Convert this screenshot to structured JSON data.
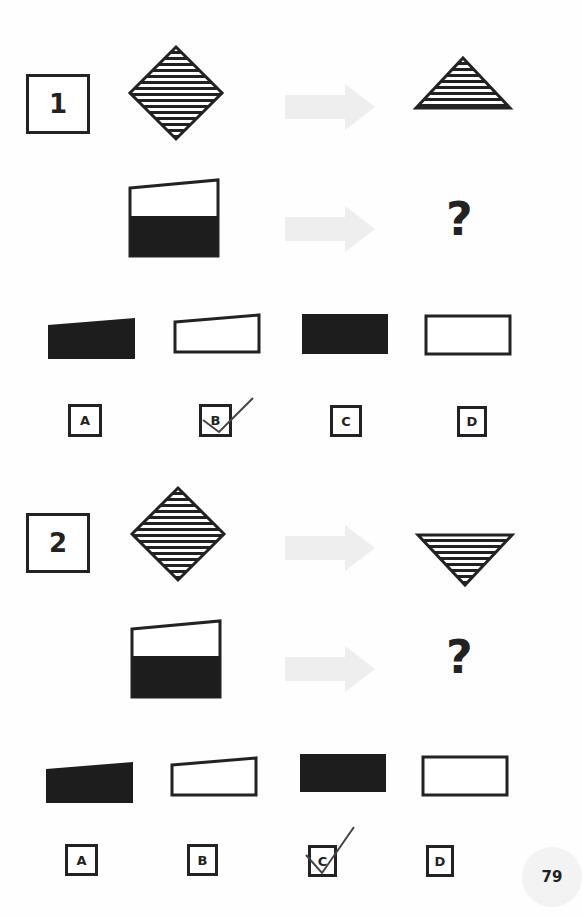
{
  "page": {
    "number": "79",
    "background": "#fefefe",
    "ink": "#222222",
    "arrow_color": "#eeeeee"
  },
  "questions": [
    {
      "number": "1",
      "example": {
        "from": "diamond-horizontal-stripes",
        "to": "upward-triangle-horizontal-stripes (top half of diamond)"
      },
      "problem": {
        "from": "quadrilateral sloped top, white top / black bottom",
        "to": "?"
      },
      "options": [
        {
          "label": "A",
          "shape": "black trapezoid with sloped top"
        },
        {
          "label": "B",
          "shape": "white trapezoid with sloped top (outlined)"
        },
        {
          "label": "C",
          "shape": "black rectangle"
        },
        {
          "label": "D",
          "shape": "white rectangle (outlined)"
        }
      ],
      "checked": "B"
    },
    {
      "number": "2",
      "example": {
        "from": "diamond-horizontal-stripes",
        "to": "downward-triangle-horizontal-stripes (bottom half of diamond)"
      },
      "problem": {
        "from": "quadrilateral sloped top, white top / black bottom",
        "to": "?"
      },
      "options": [
        {
          "label": "A",
          "shape": "black trapezoid with sloped top"
        },
        {
          "label": "B",
          "shape": "white trapezoid with sloped top (outlined)"
        },
        {
          "label": "C",
          "shape": "black rectangle"
        },
        {
          "label": "D",
          "shape": "white rectangle (outlined)"
        }
      ],
      "checked": "C"
    }
  ],
  "unknown_symbol": "?"
}
